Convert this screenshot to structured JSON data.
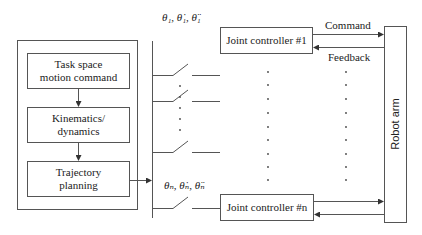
{
  "diagram": {
    "planner": {
      "task_space": "Task space motion command",
      "task_space_l1": "Task space",
      "task_space_l2": "motion command",
      "kinematics_l1": "Kinematics/",
      "kinematics_l2": "dynamics",
      "trajectory_l1": "Trajectory",
      "trajectory_l2": "planning"
    },
    "signals": {
      "joint1": "θ₁, θ̇₁, θ̈₁",
      "jointn": "θₙ, θ̇ₙ, θ̈ₙ"
    },
    "controllers": {
      "first": "Joint controller #1",
      "last": "Joint controller #n"
    },
    "arrows": {
      "command": "Command",
      "feedback": "Feedback"
    },
    "robot": "Robot arm"
  }
}
